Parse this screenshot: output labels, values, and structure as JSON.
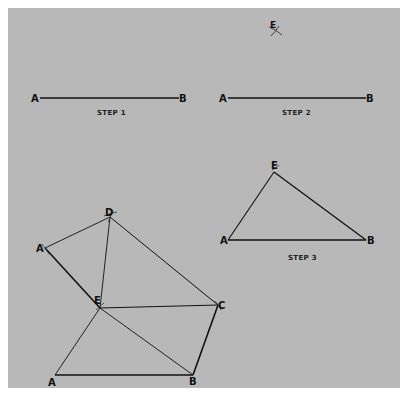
{
  "colors": {
    "background": "#ffffff",
    "panel": "#b8b8b8",
    "ink": "#111111"
  },
  "step1": {
    "caption": "STEP 1",
    "labels": {
      "a": "A",
      "b": "B"
    }
  },
  "step2": {
    "caption": "STEP 2",
    "labels": {
      "a": "A",
      "b": "B",
      "e": "E"
    }
  },
  "step3": {
    "caption": "STEP 3",
    "labels": {
      "a": "A",
      "b": "B",
      "e": "E"
    }
  },
  "figure": {
    "labels": {
      "d": "D",
      "a_prime": "A",
      "e": "E",
      "c": "C",
      "a": "A",
      "b": "B"
    }
  }
}
